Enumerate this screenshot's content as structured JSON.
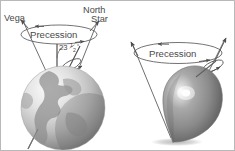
{
  "figure": {
    "background_color": "#ffffff",
    "border_color": "#b9b9b9",
    "ink_color": "#4a4a4a",
    "line_color": "#555555"
  },
  "panels": [
    {
      "id": "earth-precession",
      "name": "earth-panel",
      "labels": {
        "left_star": "Vega",
        "right_star_line1": "North",
        "right_star_line2": "Star",
        "precession": "Precession",
        "tilt_whole": "23",
        "tilt_fraction_num": "1",
        "tilt_fraction_den": "2",
        "tilt_degree": "°"
      },
      "tilt_angle_text": "23½°",
      "object": "earth-globe",
      "globe": {
        "highlight_color": "#f2f2f2",
        "mid_color": "#b8b8b8",
        "shadow_color": "#6d6d6d",
        "continent_color": "#8d8d8d"
      }
    },
    {
      "id": "top-precession",
      "name": "spinning-top-panel",
      "labels": {
        "precession": "Precession"
      },
      "object": "spinning-top",
      "top": {
        "highlight_color": "#fbfbfb",
        "mid_color": "#9a9a9a",
        "shadow_color": "#5a5a5a",
        "shadow_ellipse_color": "#cfcfcf"
      }
    }
  ]
}
